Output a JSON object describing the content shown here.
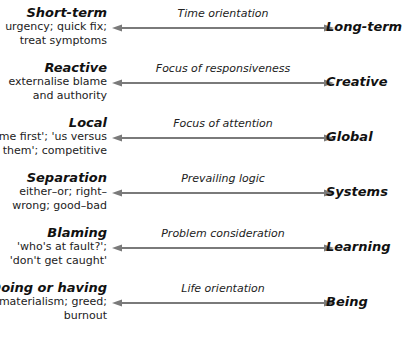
{
  "colors": {
    "arrow": "#7a7a7a",
    "text": "#111111"
  },
  "rows": [
    {
      "left_title": "Short-term",
      "left_desc": "urgency; quick fix; treat symptoms",
      "axis": "Time orientation",
      "right_title": "Long-term"
    },
    {
      "left_title": "Reactive",
      "left_desc": "externalise blame and authority",
      "axis": "Focus of responsiveness",
      "right_title": "Creative"
    },
    {
      "left_title": "Local",
      "left_desc": "'me first'; 'us versus them'; competitive",
      "axis": "Focus of attention",
      "right_title": "Global"
    },
    {
      "left_title": "Separation",
      "left_desc": "either–or; right–wrong; good–bad",
      "axis": "Prevailing logic",
      "right_title": "Systems"
    },
    {
      "left_title": "Blaming",
      "left_desc": "'who's at fault?'; 'don't get caught'",
      "axis": "Problem consideration",
      "right_title": "Learning"
    },
    {
      "left_title": "Doing or having",
      "left_desc": "materialism; greed; burnout",
      "axis": "Life orientation",
      "right_title": "Being"
    }
  ]
}
